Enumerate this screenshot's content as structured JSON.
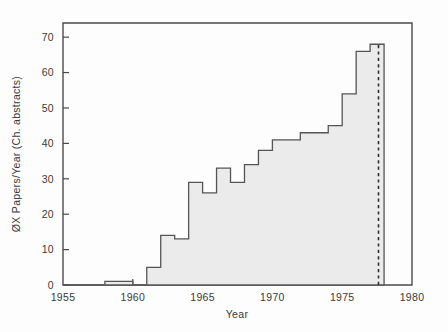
{
  "chart_data": {
    "type": "bar",
    "title": "",
    "subtitle": "",
    "xlabel": "Year",
    "ylabel": "ØX Papers/Year (Ch. abstracts)",
    "xlim": [
      1955,
      1980
    ],
    "ylim": [
      0,
      74
    ],
    "grid": false,
    "legend": null,
    "xticks": [
      1955,
      1960,
      1965,
      1970,
      1975,
      1980
    ],
    "xtick_labels": [
      "1955",
      "1960",
      "1965",
      "1970",
      "1975",
      "1980"
    ],
    "yticks": [
      0,
      10,
      20,
      30,
      40,
      50,
      60,
      70
    ],
    "ytick_labels": [
      "0",
      "10",
      "20",
      "30",
      "40",
      "50",
      "60",
      "70"
    ],
    "categories": [
      1955,
      1956,
      1957,
      1958,
      1959,
      1960,
      1961,
      1962,
      1963,
      1964,
      1965,
      1966,
      1967,
      1968,
      1969,
      1970,
      1971,
      1972,
      1973,
      1974,
      1975,
      1976,
      1977
    ],
    "values": [
      0,
      0,
      0,
      1,
      1,
      0,
      5,
      14,
      13,
      29,
      26,
      33,
      29,
      34,
      38,
      41,
      41,
      43,
      43,
      45,
      54,
      66,
      68
    ],
    "annotations": [
      {
        "name": "projection-boundary",
        "kind": "vertical-dashed-line",
        "x": 1977.6,
        "label": ""
      }
    ]
  },
  "axes": {
    "x_title": "Year",
    "y_title": "ØX Papers/Year (Ch. abstracts)"
  }
}
